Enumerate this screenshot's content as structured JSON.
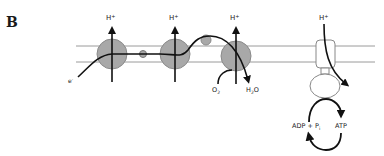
{
  "panel": {
    "label": "B"
  },
  "membrane": {
    "line_color": "#9a9a9a"
  },
  "complexes": {
    "fill_color": "#a8a8a8",
    "stroke_color": "#8a8a8a",
    "proton_label": "H",
    "proton_charge": "+"
  },
  "electron": {
    "label": "e",
    "charge": "-"
  },
  "oxygen_reaction": {
    "reactant": "O",
    "reactant_sub": "2",
    "product_h": "H",
    "product_sub": "2",
    "product_o": "O"
  },
  "atp_synthase": {
    "proton_label": "H",
    "proton_charge": "+",
    "substrate_main": "ADP + P",
    "substrate_sub": "i",
    "product": "ATP"
  }
}
